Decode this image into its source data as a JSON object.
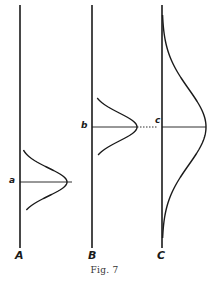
{
  "figure": {
    "caption": "Fig. 7",
    "panels": [
      {
        "id": "A",
        "axis_label": "A",
        "peak_label": "a",
        "axis_x": 20,
        "axis_top": 5,
        "axis_bottom": 248,
        "peak_y": 182,
        "peak_height": 47,
        "spread": 14,
        "extent_top": 150,
        "extent_bottom": 210,
        "line_extends_to": 72
      },
      {
        "id": "B",
        "axis_label": "B",
        "peak_label": "b",
        "axis_x": 92,
        "axis_top": 5,
        "axis_bottom": 248,
        "peak_y": 127,
        "peak_height": 45,
        "spread": 14,
        "extent_top": 98,
        "extent_bottom": 155,
        "dotted_to": 158
      },
      {
        "id": "C",
        "axis_label": "C",
        "peak_label": "c",
        "axis_x": 162,
        "axis_top": 5,
        "axis_bottom": 248,
        "peak_y": 127,
        "peak_height": 44,
        "spread": 38,
        "extent_top": 15,
        "extent_bottom": 238
      }
    ],
    "colors": {
      "ink": "#1a1a1a",
      "background": "#ffffff"
    }
  },
  "chart_data": {
    "type": "line",
    "title": "Fig. 7",
    "series": [
      {
        "name": "A",
        "mean_label": "a",
        "relative_mean": "low",
        "relative_spread": "narrow"
      },
      {
        "name": "B",
        "mean_label": "b",
        "relative_mean": "high",
        "relative_spread": "narrow"
      },
      {
        "name": "C",
        "mean_label": "c",
        "relative_mean": "high (same as b)",
        "relative_spread": "wide"
      }
    ],
    "xlabel": "",
    "ylabel": "",
    "grid": false
  }
}
